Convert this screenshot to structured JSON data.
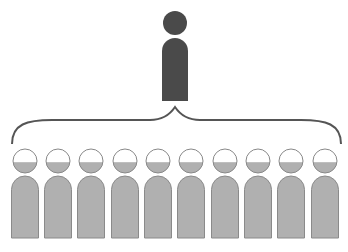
{
  "diagram": {
    "leader": {
      "label": "",
      "color": "#4a4a4a",
      "cx": 175,
      "head_cy": 23,
      "head_r": 12
    },
    "brace": {
      "color": "#555555",
      "x_left": 12,
      "x_right": 341,
      "tip_x": 175,
      "tip_y": 107
    },
    "followers": {
      "count": 10,
      "body_color": "#b0b0b0",
      "head_fill_color": "#b0b0b0",
      "head_outline_color": "#888888",
      "head_fill_fraction": 0.45,
      "centers_x": [
        25,
        58,
        91,
        125,
        158,
        191,
        225,
        258,
        291,
        325
      ]
    }
  }
}
